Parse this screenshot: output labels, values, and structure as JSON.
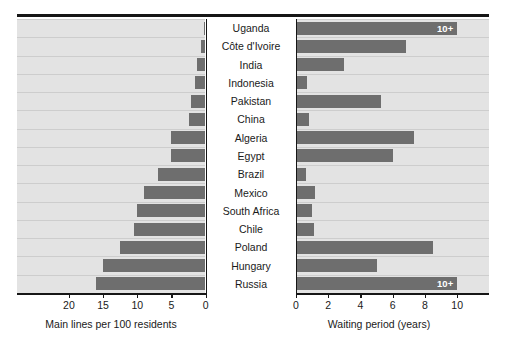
{
  "chart_data": {
    "type": "bar",
    "orientation": "diverging-horizontal",
    "title": "",
    "categories": [
      "Uganda",
      "Côte d'Ivoire",
      "India",
      "Indonesia",
      "Pakistan",
      "China",
      "Algeria",
      "Egypt",
      "Brazil",
      "Mexico",
      "South Africa",
      "Chile",
      "Poland",
      "Hungary",
      "Russia"
    ],
    "series": [
      {
        "name": "Main lines per 100 residents",
        "side": "left",
        "values": [
          0.1,
          0.6,
          1.3,
          1.5,
          2.2,
          2.5,
          5.0,
          5.0,
          7.0,
          9.0,
          10.0,
          10.5,
          12.5,
          15.0,
          16.0
        ]
      },
      {
        "name": "Waiting period (years)",
        "side": "right",
        "values": [
          10,
          6.8,
          3.0,
          0.7,
          5.3,
          0.8,
          7.3,
          6.0,
          0.6,
          1.2,
          1.0,
          1.1,
          8.5,
          5.0,
          10
        ],
        "labels": [
          "10+",
          "",
          "",
          "",
          "",
          "",
          "",
          "",
          "",
          "",
          "",
          "",
          "",
          "",
          "10+"
        ]
      }
    ],
    "left_axis": {
      "label": "Main lines per 100 residents",
      "ticks": [
        20,
        15,
        10,
        5,
        0
      ],
      "min": 0,
      "max": 23.5,
      "reversed": true
    },
    "right_axis": {
      "label": "Waiting period (years)",
      "ticks": [
        0,
        2,
        4,
        6,
        8,
        10
      ],
      "min": 0,
      "max": 11.6
    },
    "colors": {
      "bar": "#6e6e6e",
      "band": "#e3e3e3",
      "gridline": "#cdcdcd",
      "axis": "#161616",
      "label_cell": "#ffffff",
      "text": "#1a1a1a",
      "tag_text": "#ffffff"
    },
    "grid": true,
    "legend": "none"
  }
}
